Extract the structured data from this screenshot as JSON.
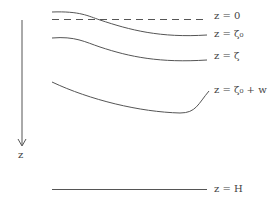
{
  "diagram": {
    "axis_label": "z",
    "labels": {
      "z0": "z = 0",
      "zeta0": "z = ζ₀",
      "zeta": "z = ζ",
      "zeta0w": "z = ζ₀ + w",
      "H": "z = H"
    },
    "colors": {
      "line": "#555555"
    }
  }
}
